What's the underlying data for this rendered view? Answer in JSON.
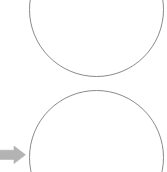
{
  "canvas": {
    "width_px": 167,
    "height_px": 172,
    "background_color": "#ffffff"
  },
  "shapes": {
    "stroke_color": "#8a8a8a",
    "fill_color": "#ffffff",
    "items": [
      {
        "name": "upper-circle",
        "type": "circle",
        "label": "",
        "x_px": 29,
        "y_px": -58,
        "diameter_px": 135,
        "clipped_edge": "top"
      },
      {
        "name": "lower-circle",
        "type": "circle",
        "label": "",
        "x_px": 29,
        "y_px": 90,
        "diameter_px": 135,
        "clipped_edge": "bottom"
      }
    ]
  },
  "marker": {
    "name": "arrow-pointer",
    "direction": "right",
    "color": "#b3b3b3",
    "x_px": 0,
    "y_px": 146,
    "width_px": 27,
    "height_px": 18,
    "label": ""
  }
}
